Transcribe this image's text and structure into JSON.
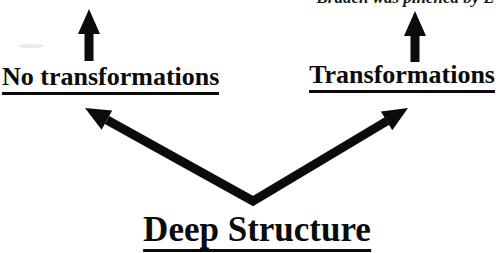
{
  "note": {
    "text": "Braden was pinched by L"
  },
  "labels": {
    "left": "No transformations",
    "right": "Transformations",
    "bottom": "Deep Structure"
  },
  "colors": {
    "ink": "#0b0b0b",
    "background": "#ffffff"
  },
  "icons": {
    "left_up_arrow": "up-arrow",
    "right_up_arrow": "up-arrow",
    "branch_arrows": "v-shaped-double-diagonal-arrows"
  }
}
